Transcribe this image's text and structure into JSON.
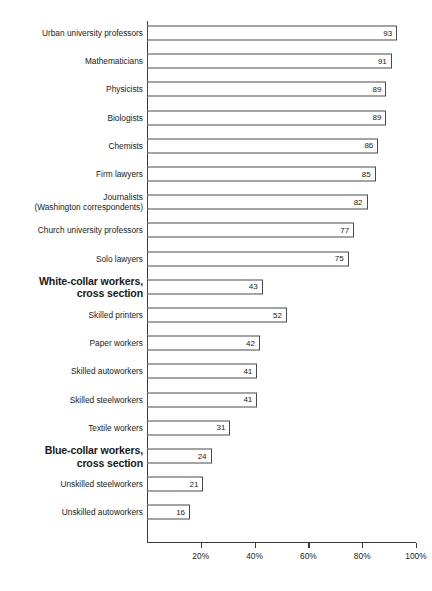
{
  "chart_data": {
    "type": "bar",
    "orientation": "horizontal",
    "title": "",
    "subtitle": "",
    "xlabel": "",
    "ylabel": "",
    "xlim": [
      0,
      100
    ],
    "grid": false,
    "legend": null,
    "value_suffix": "%",
    "xticks": [
      {
        "value": 20,
        "label": "20%"
      },
      {
        "value": 40,
        "label": "40%"
      },
      {
        "value": 60,
        "label": "60%"
      },
      {
        "value": 80,
        "label": "80%"
      },
      {
        "value": 100,
        "label": "100%"
      }
    ],
    "categories": [
      "Urban university professors",
      "Mathematicians",
      "Physicists",
      "Biologists",
      "Chemists",
      "Firm lawyers",
      "Journalists (Washington correspondents)",
      "Church university professors",
      "Solo lawyers",
      "White-collar workers, cross section",
      "Skilled printers",
      "Paper workers",
      "Skilled autoworkers",
      "Skilled steelworkers",
      "Textile workers",
      "Blue-collar workers, cross section",
      "Unskilled steelworkers",
      "Unskilled autoworkers"
    ],
    "values": [
      93,
      91,
      89,
      89,
      86,
      85,
      82,
      77,
      75,
      43,
      52,
      42,
      41,
      41,
      31,
      24,
      21,
      16
    ],
    "rows": [
      {
        "label_line1": "Urban university professors",
        "label_line2": "",
        "value": 93,
        "value_label": "93",
        "emphasis": false
      },
      {
        "label_line1": "Mathematicians",
        "label_line2": "",
        "value": 91,
        "value_label": "91",
        "emphasis": false
      },
      {
        "label_line1": "Physicists",
        "label_line2": "",
        "value": 89,
        "value_label": "89",
        "emphasis": false
      },
      {
        "label_line1": "Biologists",
        "label_line2": "",
        "value": 89,
        "value_label": "89",
        "emphasis": false
      },
      {
        "label_line1": "Chemists",
        "label_line2": "",
        "value": 86,
        "value_label": "86",
        "emphasis": false
      },
      {
        "label_line1": "Firm lawyers",
        "label_line2": "",
        "value": 85,
        "value_label": "85",
        "emphasis": false
      },
      {
        "label_line1": "Journalists",
        "label_line2": "(Washington correspondents)",
        "value": 82,
        "value_label": "82",
        "emphasis": false
      },
      {
        "label_line1": "Church university professors",
        "label_line2": "",
        "value": 77,
        "value_label": "77",
        "emphasis": false
      },
      {
        "label_line1": "Solo lawyers",
        "label_line2": "",
        "value": 75,
        "value_label": "75",
        "emphasis": false
      },
      {
        "label_line1": "White-collar workers,",
        "label_line2": "cross section",
        "value": 43,
        "value_label": "43",
        "emphasis": true
      },
      {
        "label_line1": "Skilled printers",
        "label_line2": "",
        "value": 52,
        "value_label": "52",
        "emphasis": false
      },
      {
        "label_line1": "Paper workers",
        "label_line2": "",
        "value": 42,
        "value_label": "42",
        "emphasis": false
      },
      {
        "label_line1": "Skilled autoworkers",
        "label_line2": "",
        "value": 41,
        "value_label": "41",
        "emphasis": false
      },
      {
        "label_line1": "Skilled steelworkers",
        "label_line2": "",
        "value": 41,
        "value_label": "41",
        "emphasis": false
      },
      {
        "label_line1": "Textile workers",
        "label_line2": "",
        "value": 31,
        "value_label": "31",
        "emphasis": false
      },
      {
        "label_line1": "Blue-collar workers,",
        "label_line2": "cross section",
        "value": 24,
        "value_label": "24",
        "emphasis": true
      },
      {
        "label_line1": "Unskilled steelworkers",
        "label_line2": "",
        "value": 21,
        "value_label": "21",
        "emphasis": false
      },
      {
        "label_line1": "Unskilled autoworkers",
        "label_line2": "",
        "value": 16,
        "value_label": "16",
        "emphasis": false
      }
    ]
  },
  "colors": {
    "axis": "#3a3a3a",
    "bar_outline": "#4a4a4a",
    "bar_fill": "#ffffff",
    "text": "#1a1a1a",
    "background": "#ffffff"
  }
}
